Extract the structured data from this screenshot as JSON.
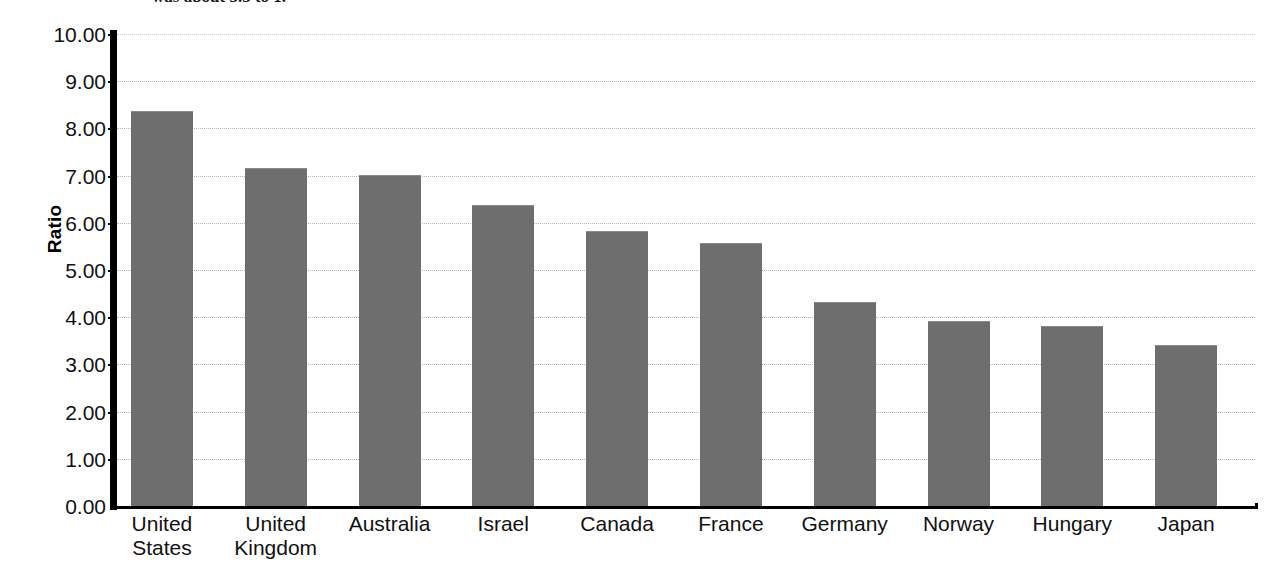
{
  "caption": {
    "partial_text_top": "was about 3.5 to 1."
  },
  "chart_data": {
    "type": "bar",
    "title": "",
    "subtitle": "",
    "xlabel": "",
    "ylabel": "Ratio",
    "ylim": [
      0,
      10
    ],
    "ytick_step": 1,
    "ytick_labels": [
      "10.00",
      "9.00",
      "8.00",
      "7.00",
      "6.00",
      "5.00",
      "4.00",
      "3.00",
      "2.00",
      "1.00",
      "0.00"
    ],
    "ytick_values": [
      10,
      9,
      8,
      7,
      6,
      5,
      4,
      3,
      2,
      1,
      0
    ],
    "grid": "horizontal-dotted",
    "legend": "none",
    "bar_color": "#6e6e6e",
    "background_color": "#ffffff",
    "axis_color": "#000000",
    "gridline_color": "#b6b6b6",
    "categories": [
      "United States",
      "United Kingdom",
      "Australia",
      "Israel",
      "Canada",
      "France",
      "Germany",
      "Norway",
      "Hungary",
      "Japan"
    ],
    "category_label_lines": [
      [
        "United",
        "States"
      ],
      [
        "United",
        "Kingdom"
      ],
      [
        "Australia"
      ],
      [
        "Israel"
      ],
      [
        "Canada"
      ],
      [
        "France"
      ],
      [
        "Germany"
      ],
      [
        "Norway"
      ],
      [
        "Hungary"
      ],
      [
        "Japan"
      ]
    ],
    "values": [
      8.35,
      7.15,
      7.0,
      6.35,
      5.8,
      5.55,
      4.3,
      3.9,
      3.8,
      3.4
    ]
  }
}
